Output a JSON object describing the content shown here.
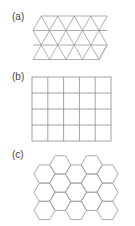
{
  "panels": [
    {
      "label": "(a)",
      "type": "triangular-lattice",
      "rows": 4
    },
    {
      "label": "(b)",
      "type": "square-lattice",
      "columns": 5,
      "rows": 4
    },
    {
      "label": "(c)",
      "type": "hexagonal-lattice",
      "columns": 5,
      "rows": 3
    }
  ],
  "colors": {
    "line": "#9a9a9a",
    "label": "#444444"
  }
}
